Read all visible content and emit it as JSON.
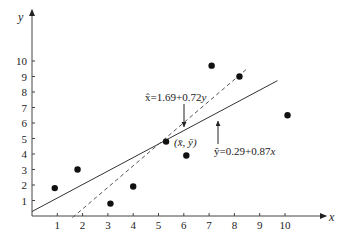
{
  "chart_data": {
    "type": "scatter",
    "title": "",
    "xlabel": "x",
    "ylabel": "y",
    "xlim": [
      0,
      11.5
    ],
    "ylim": [
      0,
      11
    ],
    "grid": false,
    "x_ticks": [
      "1",
      "2",
      "3",
      "4",
      "5",
      "6",
      "7",
      "8",
      "9",
      "10"
    ],
    "y_ticks": [
      "1",
      "2",
      "3",
      "4",
      "5",
      "6",
      "7",
      "8",
      "9",
      "10"
    ],
    "series": [
      {
        "name": "data points",
        "type": "scatter",
        "x": [
          0.9,
          1.8,
          3.1,
          4.0,
          5.3,
          6.1,
          7.1,
          8.2,
          10.1
        ],
        "y": [
          1.8,
          3.0,
          0.8,
          1.9,
          4.8,
          3.9,
          9.7,
          9.0,
          6.5
        ]
      },
      {
        "name": "ŷ=0.29+0.87x",
        "type": "line",
        "style": "solid",
        "x": [
          0,
          9.7
        ],
        "y": [
          0.29,
          8.73
        ]
      },
      {
        "name": "x̂=1.69+0.72y",
        "type": "line",
        "style": "dashed",
        "x": [
          1.6,
          8.5
        ],
        "y": [
          -0.1,
          9.5
        ]
      }
    ],
    "annotations": [
      {
        "text": "x̂=1.69+0.72y",
        "arrow": "down",
        "target_line": "dashed"
      },
      {
        "text": "ŷ=0.29+0.87x",
        "arrow": "up",
        "target_line": "solid"
      },
      {
        "text": "(x̄, ȳ)",
        "at": [
          5.3,
          4.8
        ]
      }
    ]
  },
  "labels": {
    "x_axis": "x",
    "y_axis": "y",
    "eq_dashed_hat": "x̂",
    "eq_dashed_rest": "=1.69+0.72",
    "eq_dashed_var": "y",
    "eq_solid_hat": "ŷ",
    "eq_solid_rest": "=0.29+0.87",
    "eq_solid_var": "x",
    "mean_point": "(x̄, ȳ)"
  }
}
